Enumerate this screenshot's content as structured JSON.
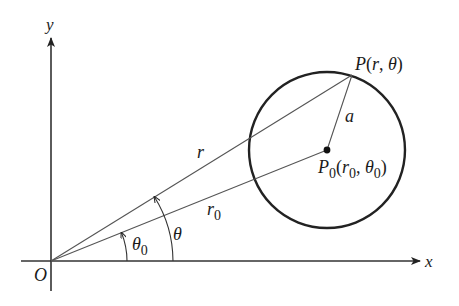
{
  "diagram": {
    "type": "polar-coordinates-circle",
    "axes": {
      "x_label": "x",
      "y_label": "y",
      "origin_label": "O"
    },
    "points": {
      "P": {
        "name": "P",
        "coords_open": "(",
        "r": "r",
        "sep": ", ",
        "theta": "θ",
        "coords_close": ")"
      },
      "P0": {
        "name": "P",
        "sub": "0",
        "r": "r",
        "theta": "θ"
      }
    },
    "segments": {
      "r_label": "r",
      "r0_label": "r",
      "r0_sub": "0",
      "radius_label": "a"
    },
    "angles": {
      "theta_label": "θ",
      "theta0_label": "θ",
      "theta0_sub": "0"
    },
    "colors": {
      "line": "#555555",
      "circle": "#222222",
      "axis": "#333333",
      "text": "#1a1a1a"
    }
  }
}
